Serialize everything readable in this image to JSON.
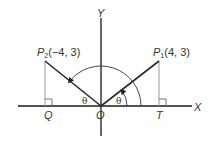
{
  "diagram": {
    "type": "coordinate-geometry",
    "colors": {
      "axis": "#1a1a1a",
      "ray": "#2a2a2a",
      "perpendicular": "#9a9a9a",
      "arc": "#333333",
      "text": "#333333"
    },
    "axes": {
      "x_label": "X",
      "y_label": "Y",
      "origin_label": "O"
    },
    "points": {
      "p1": {
        "name": "P",
        "subscript": "1",
        "coords": "(4, 3)"
      },
      "p2": {
        "name": "P",
        "subscript": "2",
        "coords": "(−4, 3)"
      },
      "t": {
        "label": "T"
      },
      "q": {
        "label": "Q"
      }
    },
    "angles": {
      "theta_right": "θ",
      "theta_left": "θ"
    }
  }
}
